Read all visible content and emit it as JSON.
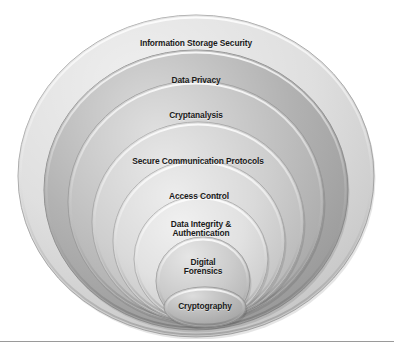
{
  "diagram": {
    "type": "nested-ellipse-hierarchy",
    "orientation": "concentric ellipses anchored near bottom center",
    "background_color": "#ffffff",
    "label_color": "#1a1a1a",
    "outline_color": "#8f8f8f",
    "bottom_rule_color": "#9a9a9a",
    "levels": [
      {
        "index": 1,
        "label": "Information Storage Security",
        "fill": "#dcdcdc",
        "stroke": "#a8a8a8",
        "cx": 196,
        "cy": 176,
        "rx": 178,
        "ry": 161,
        "label_x": 196,
        "label_y": 43,
        "font_size": 8.4
      },
      {
        "index": 2,
        "label": "Data Privacy",
        "fill": "#a9a9a9",
        "stroke": "#8e8e8e",
        "cx": 196,
        "cy": 190,
        "rx": 152,
        "ry": 140,
        "label_x": 196,
        "label_y": 80,
        "font_size": 8.4
      },
      {
        "index": 3,
        "label": "Cryptanalysis",
        "fill": "#b9b9b9",
        "stroke": "#9a9a9a",
        "cx": 196,
        "cy": 202,
        "rx": 128,
        "ry": 121,
        "label_x": 196,
        "label_y": 115,
        "font_size": 8.4
      },
      {
        "index": 4,
        "label": "Secure Communication Protocols",
        "fill": "#cacaca",
        "stroke": "#a5a5a5",
        "cx": 198,
        "cy": 222,
        "rx": 106,
        "ry": 100,
        "label_x": 198,
        "label_y": 161,
        "font_size": 8.4
      },
      {
        "index": 5,
        "label": "Access Control",
        "fill": "#d6d6d6",
        "stroke": "#aaaaaa",
        "cx": 199,
        "cy": 241,
        "rx": 86,
        "ry": 81,
        "label_x": 199,
        "label_y": 196,
        "font_size": 8.4
      },
      {
        "index": 6,
        "label": "Data Integrity &\nAuthentication",
        "fill": "#dedede",
        "stroke": "#adadad",
        "cx": 201,
        "cy": 259,
        "rx": 67,
        "ry": 63,
        "label_x": 201,
        "label_y": 229,
        "font_size": 8.4
      },
      {
        "index": 7,
        "label": "Digital\nForensics",
        "fill": "#c6c6c6",
        "stroke": "#9f9f9f",
        "cx": 203,
        "cy": 281,
        "rx": 47,
        "ry": 44,
        "label_x": 203,
        "label_y": 267,
        "font_size": 8.4
      },
      {
        "index": 8,
        "label": "Cryptography",
        "fill": "#b3b3b3",
        "stroke": "#949494",
        "cx": 205,
        "cy": 307,
        "rx": 41,
        "ry": 20,
        "label_x": 205,
        "label_y": 306,
        "font_size": 8.4
      }
    ]
  },
  "chart_data": {
    "type": "diagram",
    "title": "Information Storage Security",
    "categories": [
      "Information Storage Security",
      "Data Privacy",
      "Cryptanalysis",
      "Secure Communication Protocols",
      "Access Control",
      "Data Integrity & Authentication",
      "Digital Forensics",
      "Cryptography"
    ],
    "values": [
      8,
      7,
      6,
      5,
      4,
      3,
      2,
      1
    ],
    "xlabel": "",
    "ylabel": "Nesting level (outermost = 8)",
    "legend": []
  }
}
